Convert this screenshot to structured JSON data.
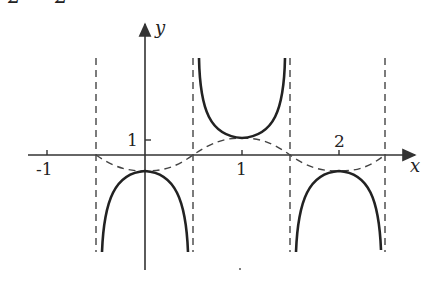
{
  "figure": {
    "type": "function-graph",
    "top_fragment": "2  2",
    "axes": {
      "x_label": "x",
      "y_label": "y",
      "x_ticks": [
        "-1",
        "1",
        "2"
      ],
      "y_ticks": [
        "1"
      ]
    },
    "asymptotes_x": [
      -0.5,
      0.5,
      1.5,
      2.5
    ],
    "colors": {
      "curve": "#222222",
      "axis": "#333333",
      "dashed": "#444444"
    }
  }
}
